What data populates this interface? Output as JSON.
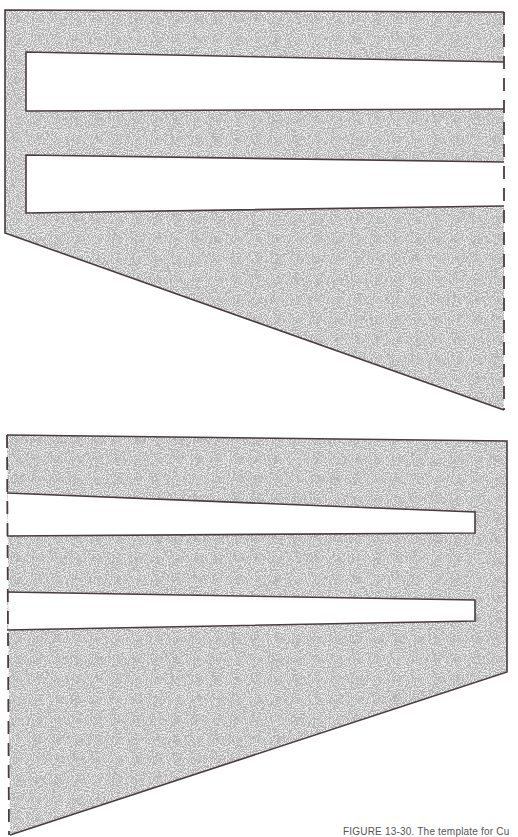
{
  "figure": {
    "caption": "FIGURE 13-30. The template for Cu",
    "colors": {
      "outline": "#4a3c3c",
      "fill_base": "#e9e9e9",
      "stipple": "#8a8a8a",
      "paper": "#ffffff"
    },
    "pieces": [
      {
        "name": "upper-template",
        "fold_edge": "right",
        "outline": [
          [
            5,
            10
          ],
          [
            504,
            12
          ],
          [
            504,
            410
          ],
          [
            5,
            233
          ]
        ],
        "slots": [
          [
            [
              26,
              52
            ],
            [
              504,
              62
            ],
            [
              504,
              109
            ],
            [
              26,
              111
            ]
          ],
          [
            [
              26,
              155
            ],
            [
              504,
              162
            ],
            [
              504,
              206
            ],
            [
              26,
              213
            ]
          ]
        ]
      },
      {
        "name": "lower-template",
        "fold_edge": "left",
        "outline": [
          [
            7,
            435
          ],
          [
            507,
            441
          ],
          [
            507,
            672
          ],
          [
            10,
            835
          ]
        ],
        "slots": [
          [
            [
              7,
              493
            ],
            [
              475,
              512
            ],
            [
              475,
              533
            ],
            [
              7,
              536
            ]
          ],
          [
            [
              7,
              592
            ],
            [
              475,
              600
            ],
            [
              475,
              621
            ],
            [
              7,
              630
            ]
          ]
        ]
      }
    ]
  }
}
